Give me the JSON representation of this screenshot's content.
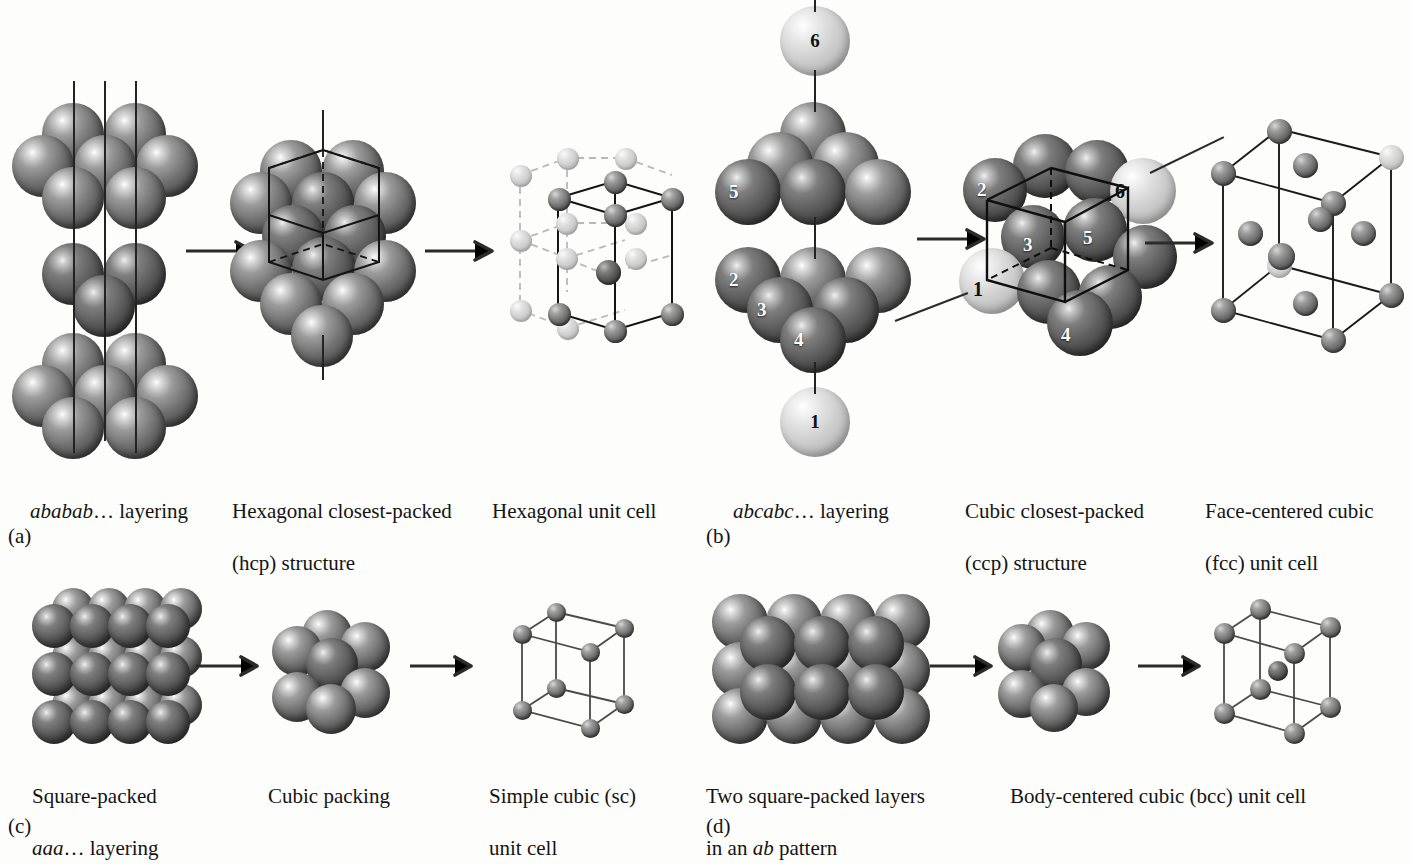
{
  "figure": {
    "background_color": "#fdfdfb",
    "sphere_dark_color": "#6f6f6f",
    "sphere_light_color": "#c3c3c3",
    "line_color": "#232323"
  },
  "panels": [
    {
      "letter": "(a)",
      "steps": [
        {
          "caption": "ababab… layering",
          "italic_prefix": "ababab",
          "plain_suffix": "… layering"
        },
        {
          "caption": "Hexagonal closest-packed\n(hcp) structure",
          "line1": "Hexagonal closest-packed",
          "line2": "(hcp) structure"
        },
        {
          "caption": "Hexagonal unit cell",
          "line1": "Hexagonal unit cell",
          "line2": ""
        }
      ]
    },
    {
      "letter": "(b)",
      "steps": [
        {
          "caption": "abcabc… layering",
          "italic_prefix": "abcabc",
          "plain_suffix": "… layering"
        },
        {
          "caption": "Cubic closest-packed\n(ccp) structure",
          "line1": "Cubic closest-packed",
          "line2": "(ccp) structure"
        },
        {
          "caption": "Face-centered cubic\n(fcc) unit cell",
          "line1": "Face-centered cubic",
          "line2": "(fcc) unit cell"
        }
      ],
      "sphere_labels": [
        "1",
        "2",
        "3",
        "4",
        "5",
        "6"
      ]
    },
    {
      "letter": "(c)",
      "steps": [
        {
          "caption": "Square-packed\naaa… layering",
          "line1": "Square-packed",
          "italic_prefix": "aaa",
          "plain_suffix": "… layering"
        },
        {
          "caption": "Cubic packing",
          "line1": "Cubic packing",
          "line2": ""
        },
        {
          "caption": "Simple cubic (sc)\nunit cell",
          "line1": "Simple cubic (sc)",
          "line2": "unit cell"
        }
      ]
    },
    {
      "letter": "(d)",
      "steps": [
        {
          "caption": "Two square-packed layers\nin an ab pattern",
          "line1": "Two square-packed layers",
          "line2_prefix": "in an ",
          "line2_italic": "ab",
          "line2_suffix": " pattern"
        },
        {
          "caption": "Body-centered cubic (bcc) unit cell",
          "line1": "Body-centered cubic (bcc) unit cell",
          "line2": ""
        }
      ]
    }
  ],
  "captions": {
    "a1_italic": "ababab",
    "a1_rest": "… layering",
    "a2_l1": "Hexagonal closest-packed",
    "a2_l2": "(hcp) structure",
    "a3_l1": "Hexagonal unit cell",
    "a_letter": "(a)",
    "b1_italic": "abcabc",
    "b1_rest": "… layering",
    "b2_l1": "Cubic closest-packed",
    "b2_l2": "(ccp) structure",
    "b3_l1": "Face-centered cubic",
    "b3_l2": "(fcc) unit cell",
    "b_letter": "(b)",
    "c1_l1": "Square-packed",
    "c1_italic": "aaa",
    "c1_rest": "… layering",
    "c2_l1": "Cubic packing",
    "c3_l1": "Simple cubic (sc)",
    "c3_l2": "unit cell",
    "c_letter": "(c)",
    "d1_l1": "Two square-packed layers",
    "d1_l2a": "in an ",
    "d1_l2_italic": "ab",
    "d1_l2b": " pattern",
    "d2_l1": "Body-centered cubic (bcc) unit cell",
    "d_letter": "(d)"
  },
  "labels": {
    "n1": "1",
    "n2": "2",
    "n3": "3",
    "n4": "4",
    "n5": "5",
    "n6": "6",
    "ccp_n1": "1",
    "ccp_n2": "2",
    "ccp_n3": "3",
    "ccp_n4": "4",
    "ccp_n5": "5",
    "ccp_n6": "6"
  }
}
